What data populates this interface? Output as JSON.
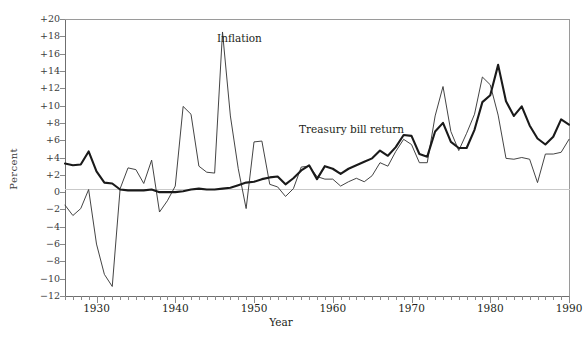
{
  "chart_data": {
    "type": "line",
    "title": "",
    "xlabel": "Year",
    "ylabel": "Percent",
    "xlim": [
      1926,
      1990
    ],
    "ylim": [
      -12,
      20
    ],
    "ytick_labels": [
      "+20",
      "+18",
      "+16",
      "+14",
      "+12",
      "+10",
      "+8",
      "+6",
      "+4",
      "+2",
      "0",
      "−2",
      "−4",
      "−6",
      "−8",
      "−10",
      "−12"
    ],
    "ytick_values": [
      20,
      18,
      16,
      14,
      12,
      10,
      8,
      6,
      4,
      2,
      0,
      -2,
      -4,
      -6,
      -8,
      -10,
      -12
    ],
    "xtick_labels": [
      "1930",
      "1940",
      "1950",
      "1960",
      "1970",
      "1980",
      "1990"
    ],
    "xtick_values": [
      1930,
      1940,
      1950,
      1960,
      1970,
      1980,
      1990
    ],
    "grid": false,
    "legend_position": "inline-annotations",
    "x": [
      1926,
      1927,
      1928,
      1929,
      1930,
      1931,
      1932,
      1933,
      1934,
      1935,
      1936,
      1937,
      1938,
      1939,
      1940,
      1941,
      1942,
      1943,
      1944,
      1945,
      1946,
      1947,
      1948,
      1949,
      1950,
      1951,
      1952,
      1953,
      1954,
      1955,
      1956,
      1957,
      1958,
      1959,
      1960,
      1961,
      1962,
      1963,
      1964,
      1965,
      1966,
      1967,
      1968,
      1969,
      1970,
      1971,
      1972,
      1973,
      1974,
      1975,
      1976,
      1977,
      1978,
      1979,
      1980,
      1981,
      1982,
      1983,
      1984,
      1985,
      1986,
      1987,
      1988,
      1989,
      1990
    ],
    "series": [
      {
        "name": "Inflation",
        "style": "thin",
        "color": "#3a3a3a",
        "values": [
          -1.5,
          -2.7,
          -1.9,
          0.3,
          -6.0,
          -9.5,
          -10.9,
          0.4,
          2.8,
          2.6,
          1.0,
          3.7,
          -2.3,
          -1.0,
          0.7,
          9.9,
          9.0,
          3.0,
          2.3,
          2.2,
          18.5,
          8.8,
          2.7,
          -1.9,
          5.8,
          5.9,
          0.9,
          0.6,
          -0.5,
          0.4,
          2.9,
          3.0,
          1.8,
          1.5,
          1.5,
          0.7,
          1.2,
          1.6,
          1.2,
          1.9,
          3.4,
          3.0,
          4.7,
          6.1,
          5.5,
          3.4,
          3.4,
          8.8,
          12.2,
          7.0,
          4.8,
          6.8,
          9.0,
          13.3,
          12.4,
          8.9,
          3.9,
          3.8,
          4.0,
          3.8,
          1.1,
          4.4,
          4.4,
          4.6,
          6.1
        ]
      },
      {
        "name": "Treasury bill return",
        "style": "thick",
        "color": "#1a1a1a",
        "values": [
          3.3,
          3.1,
          3.2,
          4.7,
          2.4,
          1.1,
          1.0,
          0.3,
          0.2,
          0.2,
          0.2,
          0.3,
          0.0,
          0.0,
          0.0,
          0.1,
          0.3,
          0.4,
          0.3,
          0.3,
          0.4,
          0.5,
          0.8,
          1.1,
          1.2,
          1.5,
          1.7,
          1.8,
          0.9,
          1.6,
          2.5,
          3.1,
          1.5,
          3.0,
          2.7,
          2.1,
          2.7,
          3.1,
          3.5,
          3.9,
          4.8,
          4.2,
          5.2,
          6.6,
          6.5,
          4.4,
          4.1,
          7.0,
          8.0,
          5.8,
          5.1,
          5.1,
          7.2,
          10.4,
          11.2,
          14.7,
          10.5,
          8.8,
          9.9,
          7.7,
          6.2,
          5.5,
          6.4,
          8.4,
          7.8
        ]
      }
    ]
  },
  "labels": {
    "inflation": "Inflation",
    "treasury": "Treasury bill return",
    "y_axis": "Percent",
    "x_axis": "Year"
  }
}
